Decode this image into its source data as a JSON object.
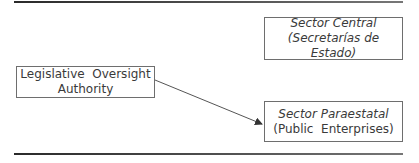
{
  "diagram": {
    "nodes": [
      {
        "id": "legislative",
        "lines": [
          "Legislative  Oversight",
          "Authority"
        ],
        "italic": [
          false,
          false
        ]
      },
      {
        "id": "central",
        "lines": [
          "Sector Central",
          "(Secretarías de Estado)"
        ],
        "italic": [
          true,
          true
        ]
      },
      {
        "id": "paraestatal",
        "lines": [
          "Sector Paraestatal",
          "(Public  Enterprises)"
        ],
        "italic": [
          true,
          false
        ]
      }
    ],
    "edges": [
      {
        "from": "legislative",
        "to": "paraestatal",
        "style": "arrow"
      }
    ],
    "colors": {
      "stroke": "#6e6e6e",
      "text": "#3a3a3a",
      "rule": "#2a2a2a"
    }
  }
}
